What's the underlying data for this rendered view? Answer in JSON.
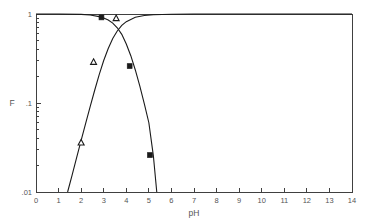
{
  "chart_data": {
    "type": "line",
    "title": "",
    "xlabel": "pH",
    "ylabel": "F",
    "yscale": "log",
    "xscale": "linear",
    "xlim": [
      0,
      14
    ],
    "ylim": [
      0.01,
      1
    ],
    "grid": false,
    "legend": null,
    "xticks": [
      0,
      1,
      2,
      3,
      4,
      5,
      6,
      7,
      8,
      9,
      10,
      11,
      12,
      13,
      14
    ],
    "xtick_labels": [
      "0",
      "1",
      "2",
      "3",
      "4",
      "5",
      "6",
      "7",
      "8",
      "9",
      "10",
      "11",
      "12",
      "13",
      "14"
    ],
    "yticks": [
      0.01,
      0.1,
      1
    ],
    "ytick_labels": [
      ".01",
      ".1",
      "1"
    ],
    "yminor_ticks": [
      0.02,
      0.03,
      0.04,
      0.05,
      0.06,
      0.07,
      0.08,
      0.09,
      0.2,
      0.3,
      0.4,
      0.5,
      0.6,
      0.7,
      0.8,
      0.9
    ],
    "series": [
      {
        "name": "rising-curve",
        "description": "Fraction increasing with pH, saturating at 1 above pH 5",
        "x": [
          1.4,
          1.6,
          1.8,
          2.0,
          2.2,
          2.4,
          2.6,
          2.8,
          3.0,
          3.2,
          3.4,
          3.6,
          3.8,
          4.0,
          4.4,
          4.8,
          5.2,
          6.0,
          7.0,
          8.0,
          10.0,
          12.0,
          14.0
        ],
        "y": [
          0.01,
          0.0155,
          0.0243,
          0.038,
          0.059,
          0.091,
          0.139,
          0.208,
          0.3,
          0.41,
          0.53,
          0.645,
          0.745,
          0.82,
          0.918,
          0.962,
          0.982,
          0.995,
          0.999,
          1.0,
          1.0,
          1.0,
          1.0
        ]
      },
      {
        "name": "falling-curve",
        "description": "Fraction decreasing with pH, saturating at 1 below pH 2",
        "x": [
          0.0,
          1.0,
          2.0,
          2.4,
          2.8,
          3.0,
          3.2,
          3.4,
          3.6,
          3.8,
          4.0,
          4.2,
          4.4,
          4.6,
          4.8,
          5.0,
          5.2,
          5.35
        ],
        "y": [
          1.0,
          0.999,
          0.99,
          0.975,
          0.935,
          0.9,
          0.855,
          0.79,
          0.7,
          0.59,
          0.46,
          0.34,
          0.235,
          0.155,
          0.098,
          0.06,
          0.0255,
          0.01
        ]
      }
    ],
    "data_points": [
      {
        "series": "falling-curve",
        "x": 2.9,
        "y": 0.915,
        "marker": "filled-square"
      },
      {
        "series": "rising-curve",
        "x": 3.55,
        "y": 0.9,
        "marker": "open-triangle"
      },
      {
        "series": "rising-curve",
        "x": 2.55,
        "y": 0.29,
        "marker": "open-triangle"
      },
      {
        "series": "falling-curve",
        "x": 4.15,
        "y": 0.26,
        "marker": "filled-square"
      },
      {
        "series": "rising-curve",
        "x": 2.0,
        "y": 0.036,
        "marker": "open-triangle"
      },
      {
        "series": "falling-curve",
        "x": 5.05,
        "y": 0.026,
        "marker": "filled-square"
      }
    ]
  },
  "axis": {
    "y_title": "F",
    "x_title": "pH"
  }
}
